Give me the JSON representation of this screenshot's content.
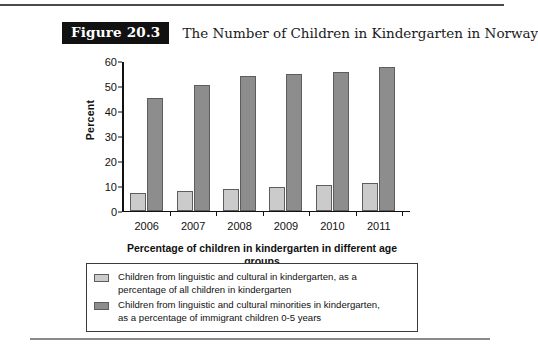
{
  "header": {
    "figure_badge": "Figure 20.3",
    "title": "The Number of Children in Kindergarten in Norway"
  },
  "chart_data": {
    "type": "bar",
    "title": "The Number of Children in Kindergarten in Norway",
    "xlabel_line1": "Percentage of children in kindergarten",
    "xlabel_line2": "in different age groups",
    "ylabel": "Percent",
    "categories": [
      "2006",
      "2007",
      "2008",
      "2009",
      "2010",
      "2011"
    ],
    "yticks": [
      "0",
      "10",
      "20",
      "30",
      "40",
      "50",
      "60"
    ],
    "ylim": [
      0,
      60
    ],
    "grid": false,
    "legend_position": "bottom",
    "series": [
      {
        "name": "Children from linguistic and cultural in kindergarten, as a percentage of all children in kindergarten",
        "legend_line1": "Children from linguistic and cultural in kindergarten, as a",
        "legend_line2": "percentage of all children in kindergarten",
        "color": "#cbcbcb",
        "values": [
          7.0,
          7.7,
          8.8,
          9.3,
          10.3,
          11.0
        ]
      },
      {
        "name": "Children from linguistic and cultural minorities in kindergarten, as a percentage of immigrant children 0-5 years",
        "legend_line1": "Children from linguistic and cultural minorities in kindergarten,",
        "legend_line2": "as a percentage of immigrant children 0-5 years",
        "color": "#8d8d8d",
        "values": [
          45.6,
          50.6,
          54.4,
          55.2,
          55.8,
          58.0
        ]
      }
    ]
  }
}
